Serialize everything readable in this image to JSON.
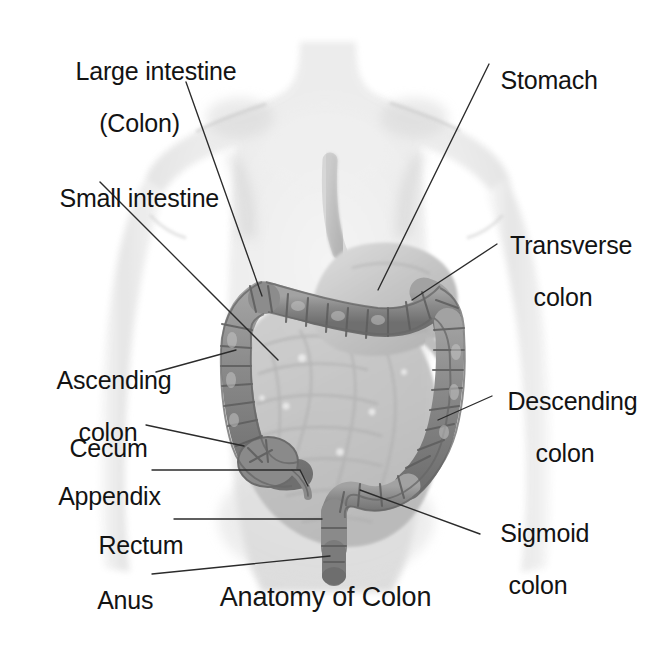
{
  "figure": {
    "title": "Anatomy of Colon",
    "palette": {
      "background": "#ffffff",
      "body_silhouette": "#e9e9e9",
      "body_shadow": "#d2d2d2",
      "small_intestine": "#bfbfbf",
      "colon_fill": "#8f8f8f",
      "colon_stroke": "#5c5c5c",
      "stomach_fill": "#c9c9c9",
      "stomach_stroke": "#a0a0a0",
      "leader_line": "#2b2b2b",
      "text": "#131313"
    }
  },
  "labels": [
    {
      "id": "large-intestine",
      "line1": "Large intestine",
      "line2": "(Colon)"
    },
    {
      "id": "small-intestine",
      "line1": "Small intestine",
      "line2": ""
    },
    {
      "id": "stomach",
      "line1": "Stomach",
      "line2": ""
    },
    {
      "id": "transverse-colon",
      "line1": "Transverse",
      "line2": "colon"
    },
    {
      "id": "ascending-colon",
      "line1": "Ascending",
      "line2": "colon"
    },
    {
      "id": "cecum",
      "line1": "Cecum",
      "line2": ""
    },
    {
      "id": "appendix",
      "line1": "Appendix",
      "line2": ""
    },
    {
      "id": "rectum",
      "line1": "Rectum",
      "line2": ""
    },
    {
      "id": "anus",
      "line1": "Anus",
      "line2": ""
    },
    {
      "id": "descending-colon",
      "line1": "Descending",
      "line2": "colon"
    },
    {
      "id": "sigmoid-colon",
      "line1": "Sigmoid",
      "line2": "colon"
    }
  ]
}
